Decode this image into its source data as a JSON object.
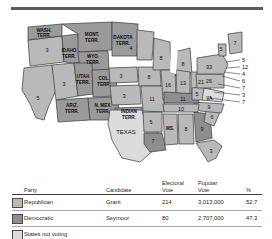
{
  "map": {
    "title": "Election of 1868",
    "states": [
      {
        "name": "Oregon",
        "party": "rep",
        "votes": "3",
        "lx": 47,
        "ly": 38
      },
      {
        "name": "California",
        "party": "rep",
        "votes": "5",
        "lx": 38,
        "ly": 86
      },
      {
        "name": "Nevada",
        "party": "rep",
        "votes": "3",
        "lx": 63,
        "ly": 73
      },
      {
        "name": "Minnesota",
        "party": "rep",
        "votes": "4",
        "lx": 131,
        "ly": 39
      },
      {
        "name": "Wisconsin",
        "party": "rep",
        "votes": "8",
        "lx": 154,
        "ly": 51
      },
      {
        "name": "Michigan",
        "party": "rep",
        "votes": "8",
        "lx": 181,
        "ly": 56
      },
      {
        "name": "Nebraska",
        "party": "rep",
        "votes": "3",
        "lx": 121,
        "ly": 62
      },
      {
        "name": "Iowa",
        "party": "rep",
        "votes": "8",
        "lx": 147,
        "ly": 65
      },
      {
        "name": "Illinois",
        "party": "rep",
        "votes": "16",
        "lx": 166,
        "ly": 73
      },
      {
        "name": "Indiana",
        "party": "rep",
        "votes": "13",
        "lx": 182,
        "ly": 73
      },
      {
        "name": "Ohio",
        "party": "rep",
        "votes": "21",
        "lx": 201,
        "ly": 71
      },
      {
        "name": "Kansas",
        "party": "rep",
        "votes": "3",
        "lx": 124,
        "ly": 84
      },
      {
        "name": "Missouri",
        "party": "rep",
        "votes": "11",
        "lx": 151,
        "ly": 87
      },
      {
        "name": "Arkansas",
        "party": "rep",
        "votes": "5",
        "lx": 150,
        "ly": 110
      },
      {
        "name": "Louisiana",
        "party": "dem",
        "votes": "7",
        "lx": 155,
        "ly": 130
      },
      {
        "name": "Alabama",
        "party": "rep",
        "votes": "8",
        "lx": 185,
        "ly": 118
      },
      {
        "name": "Georgia",
        "party": "dem",
        "votes": "9",
        "lx": 201,
        "ly": 119
      },
      {
        "name": "Florida",
        "party": "rep",
        "votes": "3",
        "lx": 212,
        "ly": 140
      },
      {
        "name": "South Carolina",
        "party": "rep",
        "votes": "6",
        "lx": 212,
        "ly": 106
      },
      {
        "name": "North Carolina",
        "party": "rep",
        "votes": "9",
        "lx": 208,
        "ly": 95
      },
      {
        "name": "Tennessee",
        "party": "rep",
        "votes": "10",
        "lx": 180,
        "ly": 98
      },
      {
        "name": "Kentucky",
        "party": "dem",
        "votes": "11",
        "lx": 182,
        "ly": 87
      },
      {
        "name": "West Virginia",
        "party": "rep",
        "votes": "5",
        "lx": 197,
        "ly": 82
      },
      {
        "name": "Pennsylvania",
        "party": "rep",
        "votes": "26",
        "lx": 208,
        "ly": 70
      },
      {
        "name": "New York",
        "party": "rep",
        "votes": "33",
        "lx": 209,
        "ly": 56
      },
      {
        "name": "Vermont",
        "party": "rep",
        "votes": "5",
        "lx": 220,
        "ly": 33
      },
      {
        "name": "Maine",
        "party": "rep",
        "votes": "7",
        "lx": 235,
        "ly": 32
      }
    ],
    "state_text_labels": [
      {
        "name": "virginia",
        "text": "VA.",
        "lx": 209,
        "ly": 86
      },
      {
        "name": "mississippi",
        "text": "MS.",
        "lx": 169,
        "ly": 116
      }
    ],
    "territories": [
      {
        "name": "washington-territory",
        "lines": [
          "WASH.",
          "TERR."
        ],
        "lx": 44,
        "ly": 22
      },
      {
        "name": "montana-territory",
        "lines": [
          "MONT.",
          "TERR."
        ],
        "lx": 87,
        "ly": 27
      },
      {
        "name": "dakota-territory",
        "lines": [
          "DAKOTA",
          "TERR."
        ],
        "lx": 118,
        "ly": 32
      },
      {
        "name": "idaho-territory",
        "lines": [
          "IDAHO",
          "TERR."
        ],
        "lx": 63,
        "ly": 44
      },
      {
        "name": "wyoming-territory",
        "lines": [
          "WYO.",
          "TERR."
        ],
        "lx": 88,
        "ly": 48
      },
      {
        "name": "utah-territory",
        "lines": [
          "UTAH",
          "TERR."
        ],
        "lx": 72,
        "ly": 69
      },
      {
        "name": "colorado-territory",
        "lines": [
          "COL.",
          "TERR."
        ],
        "lx": 99,
        "ly": 72
      },
      {
        "name": "arizona-territory",
        "lines": [
          "ARIZ.",
          "TERR."
        ],
        "lx": 70,
        "ly": 96
      },
      {
        "name": "new-mexico-territory",
        "lines": [
          "N. MEX.",
          "TERR."
        ],
        "lx": 102,
        "ly": 97
      },
      {
        "name": "indian-territory",
        "lines": [
          "INDIAN",
          "TERR."
        ],
        "lx": 128,
        "ly": 104
      }
    ],
    "texas_label": "TEXAS",
    "northeast_callouts": [
      {
        "name": "new-hampshire",
        "votes": "5"
      },
      {
        "name": "massachusetts",
        "votes": "12"
      },
      {
        "name": "rhode-island",
        "votes": "4"
      },
      {
        "name": "connecticut",
        "votes": "6"
      },
      {
        "name": "new-jersey",
        "votes": "7"
      },
      {
        "name": "delaware",
        "votes": "3"
      },
      {
        "name": "maryland",
        "votes": "7"
      }
    ]
  },
  "table": {
    "headers": {
      "party": "Party",
      "candidate": "Candidate",
      "electoral_vote": "Electoral\nVote",
      "electoral_vote_l1": "Electoral",
      "electoral_vote_l2": "Vote",
      "popular_vote_l1": "Popular",
      "popular_vote_l2": "Vote",
      "percent": "%"
    },
    "rows": [
      {
        "party": "Republican",
        "candidate": "Grant",
        "electoral": "214",
        "popular": "3,013,000",
        "percent": "52.7",
        "swatch": "rep"
      },
      {
        "party": "Democratic",
        "candidate": "Seymour",
        "electoral": "80",
        "popular": "2,707,000",
        "percent": "47.3",
        "swatch": "dem"
      }
    ],
    "footer": {
      "label": "States not voting",
      "swatch": "none"
    }
  },
  "colors": {
    "republican": "#b9b9b9",
    "democratic": "#8e8e8e",
    "not_voting": "#dcdcdc",
    "territory": "#9a9a9a",
    "outline": "#3a3a3a"
  }
}
